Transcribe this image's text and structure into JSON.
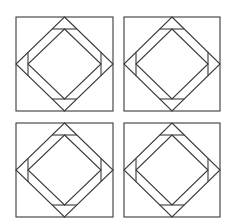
{
  "diagram": {
    "stroke_color": "#3a3a3a",
    "background": "#ffffff",
    "tiles": [
      {
        "id": "top-left",
        "x": 16,
        "y": 17,
        "w": 97,
        "h": 94
      },
      {
        "id": "top-right",
        "x": 124,
        "y": 17,
        "w": 96,
        "h": 94
      },
      {
        "id": "bottom-left",
        "x": 16,
        "y": 123,
        "w": 97,
        "h": 94
      },
      {
        "id": "bottom-right",
        "x": 124,
        "y": 123,
        "w": 96,
        "h": 94
      }
    ],
    "tile_structure": {
      "outer_square": true,
      "outer_diamond": "vertices at side midpoints",
      "side_triangles": 4,
      "triangle_depth_px": 12,
      "inner_diamond": "vertices at triangle base midpoints"
    }
  }
}
